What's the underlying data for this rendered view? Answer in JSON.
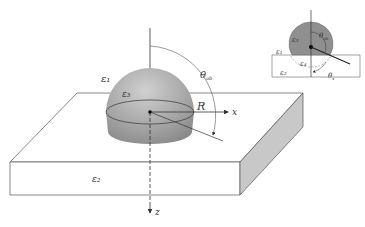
{
  "diagram": {
    "main": {
      "labels": {
        "eps1": "ε₁",
        "eps3": "ε₃",
        "eps2": "ε₂",
        "radius": "R",
        "x_axis": "x",
        "z_axis": "z",
        "theta_ob": "θ",
        "theta_ob_sub": "ob"
      }
    },
    "inset": {
      "labels": {
        "eps3": "ε₃",
        "eps1": "ε₁",
        "eps4": "ε₄",
        "eps2": "ε₂",
        "theta_ob": "θ",
        "theta_ob_sub": "ob",
        "theta_s": "θ",
        "theta_s_sub": "s"
      }
    },
    "colors": {
      "sphere": "#a8a8a8",
      "sphere_dark": "#8c8c8c",
      "inset_sphere": "#8f8f8f",
      "slab_side": "#c8c8c8",
      "line": "#444444"
    }
  }
}
